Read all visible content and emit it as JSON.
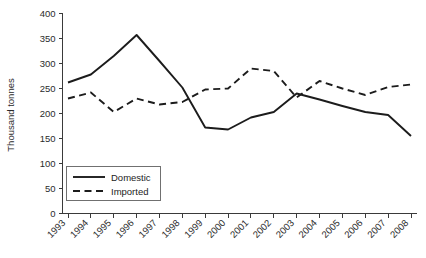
{
  "chart_data": {
    "type": "line",
    "title": "",
    "xlabel": "",
    "ylabel": "Thousand tonnes",
    "ylim": [
      0,
      400
    ],
    "ytick_step": 50,
    "yticks": [
      "0",
      "50",
      "100",
      "150",
      "200",
      "250",
      "300",
      "350",
      "400"
    ],
    "grid": false,
    "legend_position": "inside-bottom-left",
    "categories": [
      "1993",
      "1994",
      "1995",
      "1996",
      "1997",
      "1998",
      "1999",
      "2000",
      "2001",
      "2002",
      "2003",
      "2004",
      "2005",
      "2006",
      "2007",
      "2008"
    ],
    "series": [
      {
        "name": "Domestic",
        "style": "solid",
        "color": "#1c1c1c",
        "values": [
          262,
          278,
          315,
          357,
          305,
          252,
          172,
          168,
          192,
          203,
          240,
          228,
          215,
          203,
          197,
          155
        ]
      },
      {
        "name": "Imported",
        "style": "dashed",
        "color": "#1c1c1c",
        "values": [
          230,
          242,
          203,
          230,
          218,
          223,
          248,
          250,
          290,
          285,
          232,
          265,
          250,
          237,
          253,
          258
        ]
      }
    ]
  },
  "axes": {
    "y_axis_title": "Thousand tonnes"
  },
  "legend": {
    "entries": [
      {
        "label": "Domestic"
      },
      {
        "label": "Imported"
      }
    ]
  }
}
